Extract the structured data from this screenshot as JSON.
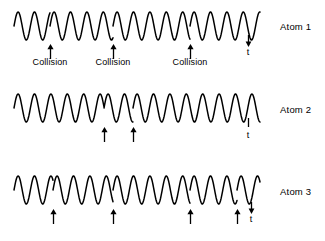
{
  "figure": {
    "title": "",
    "background_color": "#ffffff",
    "stroke_color": "#000000",
    "width": 325,
    "height": 241
  },
  "chart_data": {
    "type": "line",
    "title": "",
    "subtitle": "",
    "xlabel": "",
    "ylabel": "",
    "grid": false,
    "legend_position": "right",
    "series": [
      {
        "name": "Atom 1",
        "label": "Atom 1",
        "collision_count": 3,
        "collisions_x": [
          50,
          113,
          190
        ],
        "collision_labels": [
          "Collision",
          "Collision",
          "Collision"
        ],
        "time_marker": "t",
        "time_marker_x": 248,
        "cycles": 15,
        "amplitude": 17,
        "baseline_y": 25
      },
      {
        "name": "Atom 2",
        "label": "Atom 2",
        "collision_count": 2,
        "collisions_x": [
          104,
          133
        ],
        "collision_labels": [],
        "time_marker": "t",
        "time_marker_x": 248,
        "cycles": 15,
        "amplitude": 17,
        "baseline_y": 108
      },
      {
        "name": "Atom 3",
        "label": "Atom 3",
        "collision_count": 4,
        "collisions_x": [
          53,
          113,
          190,
          237
        ],
        "collision_labels": [],
        "time_marker": "t",
        "time_marker_x": 250,
        "cycles": 15,
        "amplitude": 17,
        "baseline_y": 190
      }
    ]
  },
  "rows": [
    {
      "atom_label": "Atom 1",
      "atom_label_x": 280,
      "atom_label_y": 21,
      "wave_top": 6,
      "wave_height": 40,
      "baseline": 20,
      "amplitude": 14,
      "x_start": 14,
      "x_end": 260,
      "period": 16.4,
      "phase_breaks": [
        50,
        113,
        190
      ],
      "arrows": [
        {
          "x": 50,
          "y": 44,
          "label": "Collision",
          "label_x": 50,
          "label_y": 57
        },
        {
          "x": 113,
          "y": 44,
          "label": "Collision",
          "label_x": 113,
          "label_y": 57
        },
        {
          "x": 190,
          "y": 44,
          "label": "Collision",
          "label_x": 190,
          "label_y": 57
        }
      ],
      "time_marker": {
        "x": 248,
        "y": 35,
        "label": "t",
        "label_y": 38,
        "style": "down-arrow"
      }
    },
    {
      "atom_label": "Atom 2",
      "atom_label_x": 280,
      "atom_label_y": 104,
      "wave_top": 88,
      "wave_height": 40,
      "baseline": 20,
      "amplitude": 14,
      "x_start": 14,
      "x_end": 260,
      "period": 16.4,
      "phase_breaks": [
        104,
        133
      ],
      "arrows": [
        {
          "x": 104,
          "y": 127,
          "label": "",
          "label_x": 104,
          "label_y": 139
        },
        {
          "x": 133,
          "y": 127,
          "label": "",
          "label_x": 133,
          "label_y": 139
        }
      ],
      "time_marker": {
        "x": 248,
        "y": 118,
        "label": "t",
        "label_y": 121,
        "style": "tick"
      }
    },
    {
      "atom_label": "Atom 3",
      "atom_label_x": 280,
      "atom_label_y": 186,
      "wave_top": 170,
      "wave_height": 40,
      "baseline": 20,
      "amplitude": 14,
      "x_start": 14,
      "x_end": 260,
      "period": 16.4,
      "phase_breaks": [
        53,
        113,
        190,
        237
      ],
      "arrows": [
        {
          "x": 53,
          "y": 209,
          "label": "",
          "label_x": 53,
          "label_y": 221
        },
        {
          "x": 113,
          "y": 209,
          "label": "",
          "label_x": 113,
          "label_y": 221
        },
        {
          "x": 190,
          "y": 209,
          "label": "",
          "label_x": 190,
          "label_y": 221
        },
        {
          "x": 237,
          "y": 209,
          "label": "",
          "label_x": 237,
          "label_y": 221
        }
      ],
      "time_marker": {
        "x": 251,
        "y": 202,
        "label": "t",
        "label_y": 205,
        "style": "down-arrow"
      }
    }
  ]
}
